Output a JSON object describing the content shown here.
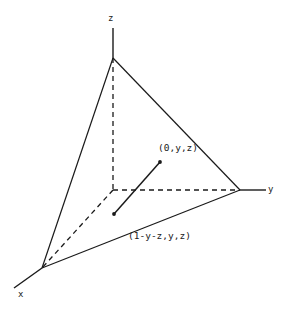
{
  "figure": {
    "type": "3d-simplex-tetrahedron",
    "background_color": "#ffffff",
    "line_color": "#1a1a1a",
    "text_color": "#1a1a1a"
  },
  "axes": [
    {
      "name": "z-axis",
      "label": "z"
    },
    {
      "name": "y-axis",
      "label": "y"
    },
    {
      "name": "x-axis",
      "label": "x"
    }
  ],
  "point_labels": [
    {
      "name": "point-label-upper",
      "text": "(0,y,z)"
    },
    {
      "name": "point-label-lower",
      "text": "(1-y-z,y,z)"
    }
  ],
  "geometry": {
    "origin": {
      "x": 113,
      "y": 190
    },
    "vertex_z": {
      "x": 113,
      "y": 58
    },
    "vertex_y": {
      "x": 240,
      "y": 190
    },
    "vertex_x": {
      "x": 42,
      "y": 268
    },
    "axis_tip_z": {
      "x": 113,
      "y": 28
    },
    "axis_tip_y": {
      "x": 266,
      "y": 190
    },
    "axis_tip_x": {
      "x": 14,
      "y": 288
    },
    "segment": {
      "name": "interior-segment",
      "start": {
        "x": 114,
        "y": 214
      },
      "end": {
        "x": 160,
        "y": 162
      }
    },
    "solid_edges": [
      {
        "name": "edge-z-to-y",
        "from": "vertex_z",
        "to": "vertex_y"
      },
      {
        "name": "edge-z-to-x",
        "from": "vertex_z",
        "to": "vertex_x"
      },
      {
        "name": "edge-x-to-y",
        "from": "vertex_x",
        "to": "vertex_y"
      }
    ],
    "dashed_edges": [
      {
        "name": "edge-origin-to-z",
        "from": "origin",
        "to": "vertex_z"
      },
      {
        "name": "edge-origin-to-y",
        "from": "origin",
        "to": "vertex_y"
      },
      {
        "name": "edge-origin-to-x",
        "from": "origin",
        "to": "vertex_x"
      }
    ]
  }
}
